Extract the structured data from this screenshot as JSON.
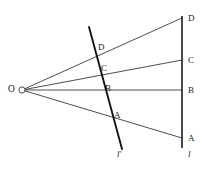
{
  "figure": {
    "type": "geometry-diagram",
    "background_color": "#ffffff",
    "stroke_color": "#3a3a3a",
    "emphasis_stroke_color": "#111111",
    "vertex": {
      "label": "O",
      "x": 22,
      "y": 90,
      "marker": "small-open-circle"
    },
    "vertical_line": {
      "name": "l",
      "label": "l",
      "x": 182,
      "y_top": 16,
      "y_bottom": 148,
      "label_x": 188,
      "label_y": 157,
      "stroke_width": 1.6
    },
    "oblique_line": {
      "name": "l-prime",
      "label": "l′",
      "x1": 89,
      "y1": 27,
      "x2": 122,
      "y2": 149,
      "label_x": 118,
      "label_y": 158,
      "stroke_width": 1.9
    },
    "rays": [
      {
        "label": "D",
        "from_x": 22,
        "from_y": 90,
        "to_x": 182,
        "to_y": 18
      },
      {
        "label": "C",
        "from_x": 22,
        "from_y": 90,
        "to_x": 182,
        "to_y": 60
      },
      {
        "label": "B",
        "from_x": 22,
        "from_y": 90,
        "to_x": 182,
        "to_y": 90
      },
      {
        "label": "A",
        "from_x": 22,
        "from_y": 90,
        "to_x": 182,
        "to_y": 138
      }
    ],
    "labels_on_vertical_line": [
      {
        "text": "D",
        "x": 188,
        "y": 14
      },
      {
        "text": "C",
        "x": 188,
        "y": 56
      },
      {
        "text": "B",
        "x": 188,
        "y": 86
      },
      {
        "text": "A",
        "x": 188,
        "y": 134
      }
    ],
    "labels_on_oblique_line": [
      {
        "text": "D",
        "x": 98,
        "y": 43
      },
      {
        "text": "C",
        "x": 101,
        "y": 64
      },
      {
        "text": "B",
        "x": 105,
        "y": 84
      },
      {
        "text": "A",
        "x": 114,
        "y": 111
      }
    ]
  }
}
